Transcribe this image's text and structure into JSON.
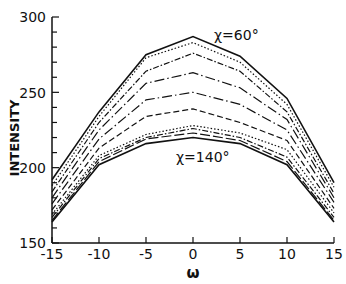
{
  "chart_data": {
    "type": "line",
    "title": "",
    "xlabel": "ω",
    "ylabel": "INTENSITY",
    "xlim": [
      -15,
      15
    ],
    "ylim": [
      150,
      300
    ],
    "x": [
      -15,
      -10,
      -5,
      0,
      5,
      10,
      15
    ],
    "x_ticks": [
      "-15",
      "-10",
      "-5",
      "0",
      "5",
      "10",
      "15"
    ],
    "y_ticks": [
      "150",
      "200",
      "250",
      "300"
    ],
    "y_minor_step": 10,
    "grid": false,
    "legend": "none",
    "annotations": [
      {
        "text": "χ=60°",
        "x": 3.5,
        "y": 290
      },
      {
        "text": "χ=140°",
        "x": 0.5,
        "y": 206
      }
    ],
    "series": [
      {
        "name": "χ=60°",
        "style": "solid",
        "values": [
          192,
          237,
          275,
          287,
          274,
          246,
          190
        ]
      },
      {
        "name": "line-2",
        "style": "dotted",
        "values": [
          188,
          234,
          273,
          283,
          270,
          242,
          187
        ]
      },
      {
        "name": "line-3",
        "style": "dashdot",
        "values": [
          184,
          230,
          264,
          276,
          264,
          237,
          183
        ]
      },
      {
        "name": "line-4",
        "style": "longdashdot",
        "values": [
          180,
          225,
          256,
          263,
          253,
          232,
          180
        ]
      },
      {
        "name": "line-5",
        "style": "longdashdot",
        "values": [
          176,
          219,
          245,
          250,
          242,
          225,
          177
        ]
      },
      {
        "name": "line-6",
        "style": "dashed",
        "values": [
          172,
          213,
          234,
          239,
          230,
          218,
          173
        ]
      },
      {
        "name": "line-7",
        "style": "dotted",
        "values": [
          169,
          208,
          222,
          228,
          223,
          212,
          170
        ]
      },
      {
        "name": "line-8",
        "style": "dashdot",
        "values": [
          167,
          206,
          220,
          226,
          220,
          207,
          167
        ]
      },
      {
        "name": "line-9",
        "style": "longdash",
        "values": [
          165,
          204,
          219,
          223,
          218,
          204,
          165
        ]
      },
      {
        "name": "χ=140°",
        "style": "solid",
        "values": [
          164,
          202,
          216,
          220,
          216,
          202,
          164
        ]
      }
    ]
  },
  "labels": {
    "ylabel": "INTENSITY",
    "xlabel": "ω",
    "annot_top": "χ=60°",
    "annot_bottom": "χ=140°",
    "yt150": "150",
    "yt200": "200",
    "yt250": "250",
    "yt300": "300",
    "xt0": "-15",
    "xt1": "-10",
    "xt2": "-5",
    "xt3": "0",
    "xt4": "5",
    "xt5": "10",
    "xt6": "15"
  }
}
